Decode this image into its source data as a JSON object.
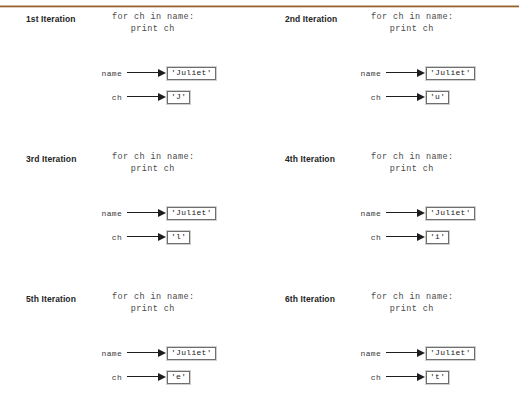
{
  "divider": {
    "color_start": "#a8753f",
    "color_end": "#d8c2a8"
  },
  "code": {
    "line1": "for ch in name:",
    "line2": "print ch"
  },
  "labels": {
    "name": "name",
    "ch": "ch"
  },
  "panels": [
    {
      "title": "1st Iteration",
      "code_line1": "for ch in name:",
      "code_line2": "print ch",
      "name_label": "name",
      "name_value": "'Juliet'",
      "ch_label": "ch",
      "ch_value": "'J'"
    },
    {
      "title": "2nd Iteration",
      "code_line1": "for ch in name:",
      "code_line2": "print ch",
      "name_label": "name",
      "name_value": "'Juliet'",
      "ch_label": "ch",
      "ch_value": "'u'"
    },
    {
      "title": "3rd Iteration",
      "code_line1": "for ch in name:",
      "code_line2": "print ch",
      "name_label": "name",
      "name_value": "'Juliet'",
      "ch_label": "ch",
      "ch_value": "'l'"
    },
    {
      "title": "4th Iteration",
      "code_line1": "for ch in name:",
      "code_line2": "print ch",
      "name_label": "name",
      "name_value": "'Juliet'",
      "ch_label": "ch",
      "ch_value": "'i'"
    },
    {
      "title": "5th Iteration",
      "code_line1": "for ch in name:",
      "code_line2": "print ch",
      "name_label": "name",
      "name_value": "'Juliet'",
      "ch_label": "ch",
      "ch_value": "'e'"
    },
    {
      "title": "6th Iteration",
      "code_line1": "for ch in name:",
      "code_line2": "print ch",
      "name_label": "name",
      "name_value": "'Juliet'",
      "ch_label": "ch",
      "ch_value": "'t'"
    }
  ]
}
